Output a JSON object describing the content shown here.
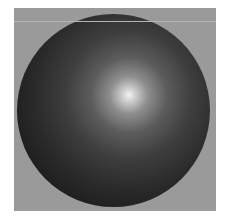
{
  "image": {
    "subject": "shaded 3D sphere",
    "background_color": "#9a9a9a",
    "frame_color": "#ffffff",
    "sphere": {
      "base_color": "#1b1b1b",
      "highlight_color": "#f4f4f4",
      "highlight_position_pct": [
        58,
        42
      ]
    }
  }
}
